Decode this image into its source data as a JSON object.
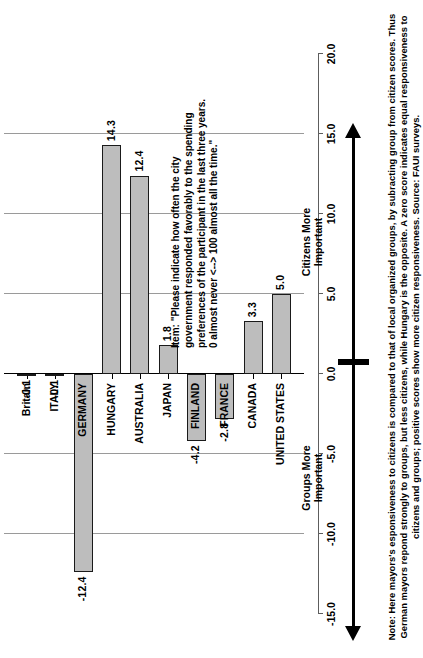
{
  "chart_data": {
    "type": "bar",
    "orientation": "vertical-rotated",
    "title": "",
    "xlabel": "",
    "ylabel": "",
    "ylim": [
      -15.0,
      20.0
    ],
    "tick_step": 5.0,
    "grid": true,
    "legend": "none",
    "tick_labels": [
      "-15.0",
      "-10.0",
      "-5.0",
      "0.0",
      "5.0",
      "10.0",
      "15.0",
      "20.0"
    ],
    "tick_values": [
      -15.0,
      -10.0,
      -5.0,
      0.0,
      5.0,
      10.0,
      15.0,
      20.0
    ],
    "categories": [
      "Britain",
      "ITALY",
      "GERMANY",
      "HUNGARY",
      "AUSTRALIA",
      "JAPAN",
      "FINLAND",
      "FRANCE",
      "CANADA",
      "UNITED STATES"
    ],
    "values": [
      -0.1,
      -0.1,
      -12.4,
      14.3,
      12.4,
      1.8,
      -4.2,
      -2.8,
      3.3,
      5.0
    ],
    "value_labels": [
      "-0.1",
      "-0.1",
      "-12.4",
      "14.3",
      "12.4",
      "1.8",
      "-4.2",
      "-2.8",
      "3.3",
      "5.0"
    ],
    "bars": [
      {
        "category": "Britain",
        "value": -0.1,
        "label": "-0.1",
        "style": "dark"
      },
      {
        "category": "ITALY",
        "value": -0.1,
        "label": "-0.1",
        "style": "dark"
      },
      {
        "category": "GERMANY",
        "value": -12.4,
        "label": "-12.4",
        "style": "light"
      },
      {
        "category": "HUNGARY",
        "value": 14.3,
        "label": "14.3",
        "style": "light"
      },
      {
        "category": "AUSTRALIA",
        "value": 12.4,
        "label": "12.4",
        "style": "light"
      },
      {
        "category": "JAPAN",
        "value": 1.8,
        "label": "1.8",
        "style": "light"
      },
      {
        "category": "FINLAND",
        "value": -4.2,
        "label": "-4.2",
        "style": "light"
      },
      {
        "category": "FRANCE",
        "value": -2.8,
        "label": "-2.8",
        "style": "light"
      },
      {
        "category": "CANADA",
        "value": 3.3,
        "label": "3.3",
        "style": "light"
      },
      {
        "category": "UNITED STATES",
        "value": 5.0,
        "label": "5.0",
        "style": "light"
      }
    ],
    "annotations": [
      {
        "name": "citizens-more-important",
        "text": "Citizens More\nImportant",
        "direction": "positive",
        "from": 0.0,
        "to": 15.0
      },
      {
        "name": "groups-more-important",
        "text": "Groups More\nImportant",
        "direction": "negative",
        "from": 0.0,
        "to": -14.0
      }
    ],
    "colors": {
      "bar_fill": "#bdbdbd",
      "bar_fill_dark": "#8f8f8f",
      "bar_border": "#1a1a1a",
      "gridline": "#9a9a9a",
      "axis": "#5d5d5d",
      "text": "#000000",
      "background": "#ffffff"
    }
  },
  "annotations": {
    "citizens_label_line1": "Citizens More",
    "citizens_label_line2": "Important",
    "groups_label_line1": "Groups More",
    "groups_label_line2": "Important"
  },
  "item_text": "Item: \"Please indicate how often the city\ngovernment responded favorably to the spending\npreferences of the participant in the last three years.\n0 almost never <--> 100 almost all the time.\"",
  "note_text": "Note: Here mayors's esponsiveness to citizens is compared to that of local organized groups, by subracting group from citizen scores. Thus\nGerman mayors repond strongly to groups, but less citizens, while Hungary is the opposite. A zero score indicates equal responsiveness to\ncitizens and groups; positive scores show more citizen responsiveness.  Source:  FAUI surveys."
}
